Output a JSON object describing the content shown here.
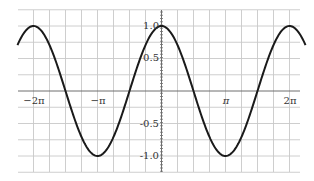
{
  "chart_data": {
    "type": "line",
    "title": "",
    "xlabel": "",
    "ylabel": "",
    "function": "y = cos(x)",
    "series": [
      {
        "name": "cos(x)",
        "color": "#1a1a1a",
        "x": [
          "-9π/4",
          "-2π",
          "-3π/2",
          "-π",
          "-π/2",
          "0",
          "π/2",
          "π",
          "3π/2",
          "2π",
          "9π/4"
        ],
        "values": [
          0.707,
          1.0,
          0.0,
          -1.0,
          0.0,
          1.0,
          0.0,
          -1.0,
          0.0,
          1.0,
          0.707
        ]
      }
    ],
    "x_tick_labels": [
      "-2π",
      "-π",
      "π",
      "2π"
    ],
    "y_tick_labels": [
      "1.0",
      "0.5",
      "-0.5",
      "-1.0"
    ],
    "xlim": [
      "-9π/4",
      "9π/4"
    ],
    "ylim": [
      -1.25,
      1.25
    ],
    "grid": true,
    "grid_x_step": "π/4",
    "grid_y_step": 0.25,
    "legend": "none"
  },
  "labels": {
    "x_neg2pi": "−2π",
    "x_negpi": "−π",
    "x_pi": "π",
    "x_2pi": "2π",
    "y_1": "1.0",
    "y_05": "0.5",
    "y_neg05": "-0.5",
    "y_neg1": "-1.0"
  }
}
